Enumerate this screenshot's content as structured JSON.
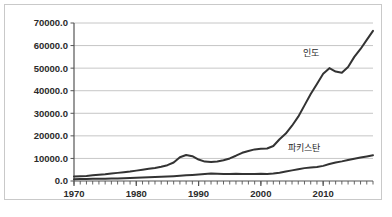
{
  "chart_data": {
    "type": "line",
    "title": "",
    "xlabel": "",
    "ylabel": "",
    "xlim": [
      1970,
      2018
    ],
    "ylim": [
      0,
      70000
    ],
    "grid": true,
    "grid_axis": "y",
    "legend_position": "inline-annotation",
    "y_ticks": [
      "0.0",
      "10000.0",
      "20000.0",
      "30000.0",
      "40000.0",
      "50000.0",
      "60000.0",
      "70000.0"
    ],
    "y_tick_values": [
      0,
      10000,
      20000,
      30000,
      40000,
      50000,
      60000,
      70000
    ],
    "x_ticks": [
      "1970",
      "1980",
      "1990",
      "2000",
      "2010"
    ],
    "x_tick_values": [
      1970,
      1980,
      1990,
      2000,
      2010
    ],
    "x_minor_tick_interval": 1,
    "line_color": "#333333",
    "grid_color": "#b8b8b8",
    "axis_color": "#555555",
    "series": [
      {
        "name": "인도",
        "label_x": 2008,
        "label_y": 55500,
        "x": [
          1970,
          1971,
          1972,
          1973,
          1974,
          1975,
          1976,
          1977,
          1978,
          1979,
          1980,
          1981,
          1982,
          1983,
          1984,
          1985,
          1986,
          1987,
          1988,
          1989,
          1990,
          1991,
          1992,
          1993,
          1994,
          1995,
          1996,
          1997,
          1998,
          1999,
          2000,
          2001,
          2002,
          2003,
          2004,
          2005,
          2006,
          2007,
          2008,
          2009,
          2010,
          2011,
          2012,
          2013,
          2014,
          2015,
          2016,
          2017,
          2018
        ],
        "values": [
          2000,
          2100,
          2200,
          2500,
          2800,
          3000,
          3300,
          3600,
          3900,
          4200,
          4600,
          5000,
          5400,
          5800,
          6300,
          7000,
          8200,
          10500,
          11500,
          11000,
          9500,
          8600,
          8400,
          8600,
          9200,
          10000,
          11200,
          12500,
          13300,
          14000,
          14300,
          14400,
          15500,
          18500,
          21000,
          24500,
          28500,
          33500,
          38500,
          43000,
          47500,
          50000,
          48500,
          48000,
          50500,
          55000,
          58500,
          62500,
          66500
        ]
      },
      {
        "name": "파키스탄",
        "label_x": 2007,
        "label_y": 13200,
        "x": [
          1970,
          1971,
          1972,
          1973,
          1974,
          1975,
          1976,
          1977,
          1978,
          1979,
          1980,
          1981,
          1982,
          1983,
          1984,
          1985,
          1986,
          1987,
          1988,
          1989,
          1990,
          1991,
          1992,
          1993,
          1994,
          1995,
          1996,
          1997,
          1998,
          1999,
          2000,
          2001,
          2002,
          2003,
          2004,
          2005,
          2006,
          2007,
          2008,
          2009,
          2010,
          2011,
          2012,
          2013,
          2014,
          2015,
          2016,
          2017,
          2018
        ],
        "values": [
          800,
          850,
          900,
          950,
          1000,
          1050,
          1100,
          1150,
          1250,
          1350,
          1450,
          1550,
          1700,
          1800,
          1900,
          2000,
          2150,
          2300,
          2500,
          2700,
          2900,
          3100,
          3300,
          3200,
          3150,
          3150,
          3200,
          3150,
          3100,
          3150,
          3200,
          3150,
          3300,
          3700,
          4200,
          4700,
          5200,
          5700,
          6000,
          6200,
          6700,
          7500,
          8200,
          8700,
          9300,
          9900,
          10400,
          10900,
          11400
        ]
      }
    ]
  },
  "caption": {
    "text": " "
  }
}
